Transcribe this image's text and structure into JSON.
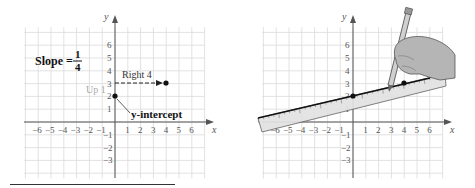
{
  "figure": {
    "left_panel": {
      "title_prefix": "Slope = ",
      "slope_numerator": "1",
      "slope_denominator": "4",
      "label_up": "Up 1",
      "label_right": "Right 4",
      "label_intercept": "y-intercept",
      "x_axis_label": "x",
      "y_axis_label": "y",
      "points": [
        [
          0,
          2
        ],
        [
          4,
          3
        ]
      ]
    },
    "right_panel": {
      "x_axis_label": "x",
      "y_axis_label": "y",
      "points": [
        [
          0,
          2
        ],
        [
          4,
          3
        ]
      ],
      "illustration": "hand drawing line along ruler with pencil"
    },
    "x_ticks": [
      "-6",
      "-5",
      "-4",
      "-3",
      "-2",
      "-1",
      "1",
      "2",
      "3",
      "4",
      "5",
      "6"
    ],
    "y_ticks_pos": [
      "1",
      "2",
      "3",
      "4",
      "5",
      "6"
    ],
    "y_ticks_neg": [
      "-1",
      "-2",
      "-3"
    ],
    "colors": {
      "grid": "#d8d8d8",
      "axis": "#555555",
      "label_up": "#aaaaaa",
      "ruler_fill": "#e2e2e2",
      "hand_fill": "#b5b5b5"
    }
  },
  "chart_data": {
    "type": "line",
    "xlabel": "x",
    "ylabel": "y",
    "xlim": [
      -6,
      6
    ],
    "ylim": [
      -3,
      6
    ],
    "grid": true,
    "series": [
      {
        "name": "line through y-intercept",
        "x": [
          0,
          4
        ],
        "y": [
          2,
          3
        ]
      }
    ],
    "annotations": [
      "Up 1",
      "Right 4",
      "y-intercept"
    ]
  }
}
